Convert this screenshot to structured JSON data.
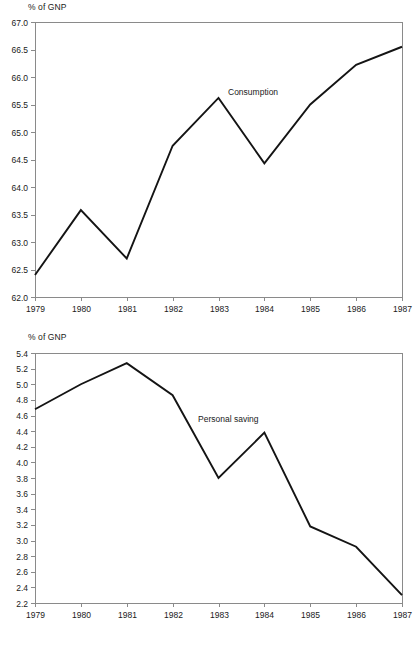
{
  "page": {
    "background_color": "#ffffff",
    "line_color": "#141414",
    "axis_color": "#8a8a8a",
    "text_color": "#1a1a1a"
  },
  "charts": [
    {
      "id": "consumption",
      "axis_unit_label": "% of GNP",
      "series_label": "Consumption",
      "chart_data": {
        "type": "line",
        "title": "",
        "subtitle": "",
        "xlabel": "",
        "ylabel": "% of GNP",
        "x": [
          1979,
          1980,
          1981,
          1982,
          1983,
          1984,
          1985,
          1986,
          1987
        ],
        "xtick_labels": [
          "1979",
          "1980",
          "1981",
          "1982",
          "1983",
          "1984",
          "1985",
          "1986",
          "1987"
        ],
        "ytick_labels": [
          "62.0",
          "62.5",
          "63.0",
          "63.5",
          "64.0",
          "64.5",
          "65.0",
          "65.5",
          "66.0",
          "66.5",
          "67.0"
        ],
        "ytick_values": [
          62.0,
          62.5,
          63.0,
          63.5,
          64.0,
          64.5,
          65.0,
          65.5,
          66.0,
          66.5,
          67.0
        ],
        "ylim": [
          62.0,
          67.0
        ],
        "xlim": [
          1979,
          1987
        ],
        "grid": false,
        "legend_position": "inline-annotation",
        "series": [
          {
            "name": "Consumption",
            "values": [
              62.4,
              63.58,
              62.7,
              64.75,
              65.62,
              64.43,
              65.5,
              66.22,
              66.55
            ]
          }
        ]
      }
    },
    {
      "id": "saving",
      "axis_unit_label": "% of GNP",
      "series_label": "Personal saving",
      "chart_data": {
        "type": "line",
        "title": "",
        "subtitle": "",
        "xlabel": "",
        "ylabel": "% of GNP",
        "x": [
          1979,
          1980,
          1981,
          1982,
          1983,
          1984,
          1985,
          1986,
          1987
        ],
        "xtick_labels": [
          "1979",
          "1980",
          "1981",
          "1982",
          "1983",
          "1984",
          "1985",
          "1986",
          "1987"
        ],
        "ytick_labels": [
          "2.2",
          "2.4",
          "2.6",
          "2.8",
          "3.0",
          "3.2",
          "3.4",
          "3.6",
          "3.8",
          "4.0",
          "4.2",
          "4.4",
          "4.6",
          "4.8",
          "5.0",
          "5.2",
          "5.4"
        ],
        "ytick_values": [
          2.2,
          2.4,
          2.6,
          2.8,
          3.0,
          3.2,
          3.4,
          3.6,
          3.8,
          4.0,
          4.2,
          4.4,
          4.6,
          4.8,
          5.0,
          5.2,
          5.4
        ],
        "ylim": [
          2.2,
          5.4
        ],
        "xlim": [
          1979,
          1987
        ],
        "grid": false,
        "legend_position": "inline-annotation",
        "series": [
          {
            "name": "Personal saving",
            "values": [
              4.68,
              5.0,
              5.27,
              4.86,
              3.8,
              4.38,
              3.18,
              2.92,
              2.3
            ]
          }
        ]
      }
    }
  ]
}
